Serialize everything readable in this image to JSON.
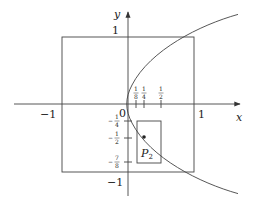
{
  "diagram": {
    "type": "coordinate-plot",
    "axes": {
      "x_label": "x",
      "y_label": "y",
      "origin_label": "0"
    },
    "tick_labels": {
      "x_neg_one": "−1",
      "x_one": "1",
      "y_one": "1",
      "y_neg_one": "−1"
    },
    "x_ticks": [
      {
        "num": "1",
        "den": "8",
        "value": 0.125
      },
      {
        "num": "1",
        "den": "4",
        "value": 0.25
      },
      {
        "num": "1",
        "den": "2",
        "value": 0.5
      }
    ],
    "y_ticks": [
      {
        "sign": "−",
        "num": "1",
        "den": "4",
        "value": -0.25
      },
      {
        "sign": "−",
        "num": "1",
        "den": "2",
        "value": -0.5
      },
      {
        "sign": "−",
        "num": "7",
        "den": "8",
        "value": -0.875
      }
    ],
    "curve": {
      "equation": "x = y^2",
      "description": "parabola opening right"
    },
    "square": {
      "x_range": [
        -1,
        1
      ],
      "y_range": [
        -1,
        1
      ]
    },
    "rectangle": {
      "x_range": [
        0.125,
        0.5
      ],
      "y_range": [
        -0.875,
        -0.25
      ]
    },
    "point": {
      "label": "P",
      "subscript": "2",
      "x": 0.25,
      "y": -0.5
    },
    "colors": {
      "stroke": "#333333",
      "background": "#ffffff"
    }
  }
}
